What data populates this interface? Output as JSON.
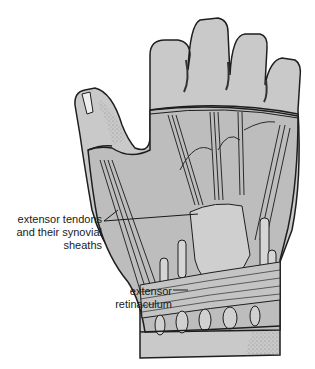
{
  "figure": {
    "colors": {
      "background": "#ffffff",
      "skin_fill": "#c9c9c9",
      "skin_shadow": "#9a9a9a",
      "inner_fill": "#bdbdbd",
      "outline": "#1e1e1e",
      "tendon": "#2b2b2b"
    }
  },
  "labels": {
    "tendons": {
      "line1": "extensor tendons",
      "line2": "and their synovial",
      "line3": "sheaths"
    },
    "retinaculum": {
      "line1": "extensor",
      "line2": "retinaculum"
    }
  }
}
